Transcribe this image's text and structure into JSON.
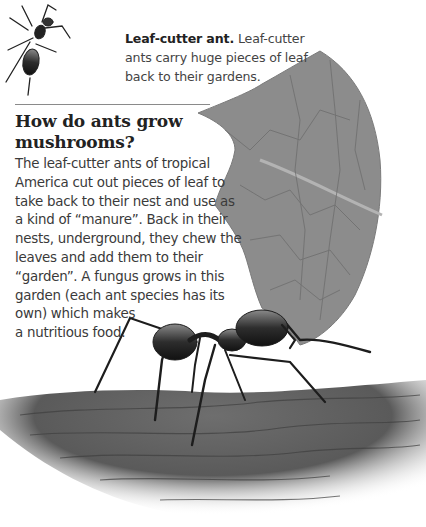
{
  "caption": {
    "title": "Leaf-cutter ant.",
    "text": "Leaf-cutter ants carry huge pieces of leaf back to their gardens."
  },
  "article": {
    "heading": "How do ants grow mushrooms?",
    "body_lines": [
      "The leaf-cutter ants of tropical",
      "America cut out pieces of leaf to",
      "take back to their nest and use as",
      "a kind of “manure”. Back in their",
      "nests, underground, they chew the",
      "leaves and add them to their",
      "“garden”. A fungus grows in this",
      "garden (each ant species has its",
      "own) which makes",
      "a nutritious food."
    ]
  },
  "illustrations": {
    "small_ant": "small-ant-illustration",
    "leaf": "leaf-fragment-illustration",
    "large_ant": "leaf-cutter-ant-illustration",
    "ground": "wood-ground-illustration"
  }
}
